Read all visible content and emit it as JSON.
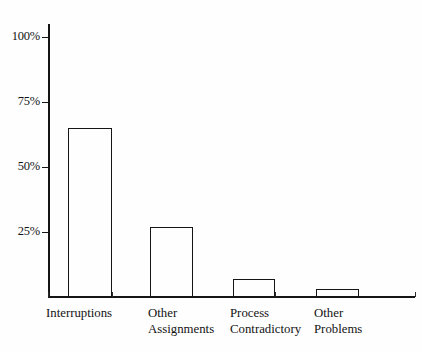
{
  "chart_data": {
    "type": "bar",
    "title": "",
    "subtitle": "",
    "xlabel": "",
    "ylabel": "",
    "categories": [
      "Interruptions",
      "Other Assignments",
      "Process Contradictory",
      "Other Problems"
    ],
    "category_lines": [
      [
        "Interruptions"
      ],
      [
        "Other",
        "Assignments"
      ],
      [
        "Process",
        "Contradictory"
      ],
      [
        "Other",
        "Problems"
      ]
    ],
    "values": [
      65,
      27,
      7,
      3
    ],
    "value_unit": "%",
    "ylim": [
      0,
      100
    ],
    "ytick_values": [
      25,
      50,
      75,
      100
    ],
    "ytick_labels": [
      "25%",
      "50%",
      "75%",
      "100%"
    ],
    "grid": false,
    "legend": null,
    "bar_style": "hollow-outline",
    "colors": {
      "axis": "#151515",
      "bar_outline": "#151515",
      "bar_fill": "transparent",
      "background": "#fefefe",
      "text": "#131313"
    }
  },
  "geometry": {
    "axis_x": 48,
    "baseline_y": 297,
    "top_y": 24,
    "px_per_25pct": 65,
    "bars": [
      {
        "left": 68,
        "width": 44,
        "top": 114
      },
      {
        "left": 150,
        "width": 43,
        "top": 214
      },
      {
        "left": 233,
        "width": 42,
        "top": 269
      },
      {
        "left": 316,
        "width": 43,
        "top": 282
      }
    ],
    "label_left": [
      46,
      148,
      230,
      314
    ],
    "xticks": [
      48,
      112,
      192,
      275,
      358,
      415
    ]
  }
}
